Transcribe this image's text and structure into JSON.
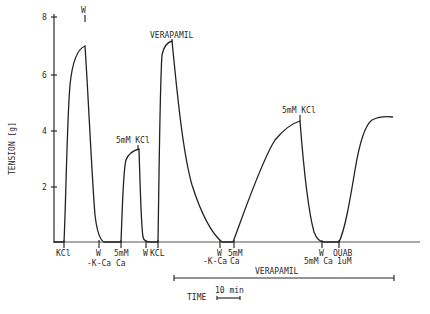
{
  "chart_data": {
    "type": "line",
    "title": "",
    "xlabel": "TIME",
    "ylabel": "TENSION [g]",
    "ylim": [
      0,
      8
    ],
    "yticks": [
      2,
      4,
      6,
      8
    ],
    "grid": false,
    "time_scale_bar": "10 min",
    "series": [
      {
        "name": "tension trace",
        "points_px": "M54,242 L64,242 C66,200 67,120 70,85 C73,55 80,48 85,46 C88,90 92,180 95,215 C97,232 100,240 104,242 L121,242 C122,220 123,170 126,160 C129,152 135,150 139,149 C140,180 141,225 143,237 C144,241 146,242 150,242 L158,242 C159,180 160,80 162,55 C164,45 168,42 172,41 C176,80 182,150 192,185 C200,210 210,232 222,242 L233,242 C245,210 262,160 275,140 C285,128 293,123 300,121 C303,160 308,210 314,232 C317,240 320,242 324,242 L339,242 C345,230 350,200 355,170 C360,140 365,125 372,120 C378,117 385,116 393,117",
        "segments": [
          {
            "event": "KCl",
            "start_g": 0,
            "peak_g": 7.0
          },
          {
            "event": "5mM Ca",
            "start_g": 0,
            "peak_g": 3.35
          },
          {
            "event": "KCL (+Verapamil)",
            "start_g": 0,
            "peak_g": 7.2
          },
          {
            "event": "5mM Ca (Verapamil)",
            "start_g": 0,
            "peak_g": 4.35
          },
          {
            "event": "OUAB 1uM",
            "start_g": 0,
            "peak_g": 4.5
          }
        ]
      }
    ],
    "annotations": {
      "top": [
        {
          "id": "w1",
          "text": "W",
          "x": 85,
          "y": 14
        },
        {
          "id": "kcl2",
          "text": "5mM KCl",
          "x": 127,
          "y": 142
        },
        {
          "id": "verapamil",
          "text": "VERAPAMIL",
          "x": 178,
          "y": 38
        },
        {
          "id": "kcl3",
          "text": "5mM KCl",
          "x": 294,
          "y": 117
        }
      ],
      "bottom": [
        {
          "id": "kcl1",
          "line1": "KCl",
          "line2": "",
          "x": 64
        },
        {
          "id": "w-kca1",
          "line1": "W",
          "line2": "-K-Ca",
          "x": 99
        },
        {
          "id": "ca1",
          "line1": "5mM",
          "line2": "Ca",
          "x": 121
        },
        {
          "id": "w2",
          "line1": "W",
          "line2": "",
          "x": 146
        },
        {
          "id": "kcl-b",
          "line1": "KCL",
          "line2": "",
          "x": 158
        },
        {
          "id": "w-kca2",
          "line1": "W",
          "line2": "-K-Ca",
          "x": 220
        },
        {
          "id": "ca2",
          "line1": "5mM",
          "line2": "Ca",
          "x": 234
        },
        {
          "id": "w3",
          "line1": "W",
          "line2": "5mM Ca",
          "x": 322
        },
        {
          "id": "ouab",
          "line1": "OUAB",
          "line2": "1uM",
          "x": 339
        }
      ],
      "verapamil_bar": {
        "text": "VERAPAMIL",
        "x1": 174,
        "x2": 394,
        "y": 278
      }
    }
  },
  "axis": {
    "ylabel": "TENSION [g]",
    "tick_labels": [
      "2",
      "4",
      "6",
      "8"
    ],
    "time_label": "TIME",
    "time_scale": "10 min"
  }
}
